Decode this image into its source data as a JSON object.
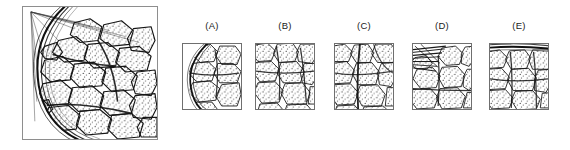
{
  "figure": {
    "kind": "histology-multiple-choice-figure",
    "background_color": "#ffffff",
    "ink_color": "#1a1a1a",
    "border_color": "#8e8e8e",
    "main_image": {
      "caption": "",
      "description": "Line drawing of lymphoid organ cortex: dense polygonal lobules with stippled interiors enclosed by a thick fibrous capsule curving along the left and lower-left margins; thin trabecular fibers radiate from a point beyond the upper-left corner.",
      "alt_text": "reference micrograph drawing"
    },
    "options": [
      {
        "id": "a",
        "label": "(A)",
        "description": "Crop containing the curved capsule along the left border with lobules filling the right two-thirds."
      },
      {
        "id": "b",
        "label": "(B)",
        "description": "Crop of interior lobules, no capsule visible, uniform polygonal cell clusters."
      },
      {
        "id": "c",
        "label": "(C)",
        "description": "Crop of interior lobules with a prominent dark septum running vertically through the centre."
      },
      {
        "id": "d",
        "label": "(D)",
        "description": "Crop with converging fibrous strands entering from the upper-left corner above a row of lobules."
      },
      {
        "id": "e",
        "label": "(E)",
        "description": "Crop of densely packed lobules with a thick trabecula along the upper border."
      }
    ]
  }
}
